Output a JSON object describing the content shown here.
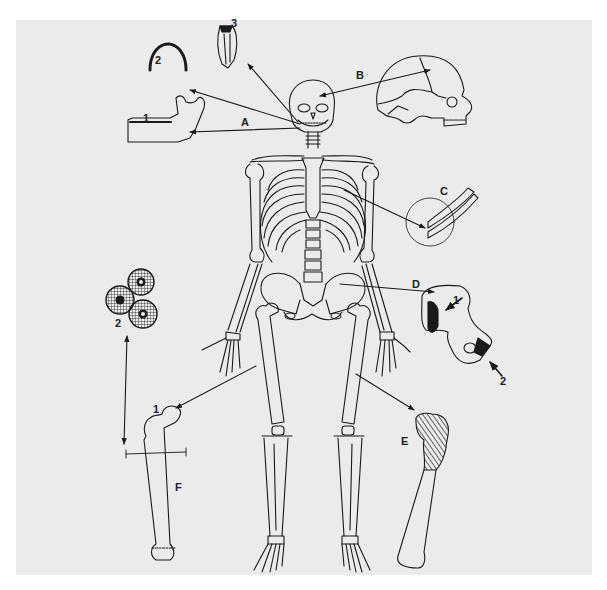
{
  "figure": {
    "type": "anatomical skeleton diagram with callouts",
    "background": "#ebebeb",
    "ink": "#1a1a1a",
    "center_subject": "full human skeleton, anterior view"
  },
  "callouts": {
    "A": {
      "letter": "A",
      "items": [
        {
          "number": "1",
          "subject": "mandible with teeth"
        },
        {
          "number": "2",
          "subject": "dental arch (upper teeth, occlusal view)"
        },
        {
          "number": "3",
          "subject": "single tooth, sectioned"
        }
      ]
    },
    "B": {
      "letter": "B",
      "subject": "skull, lateral view with sutures"
    },
    "C": {
      "letter": "C",
      "subject": "rib segments in circle"
    },
    "D": {
      "letter": "D",
      "subject": "pelvic bone fragment with marked areas",
      "items": [
        {
          "number": "1"
        },
        {
          "number": "2"
        }
      ]
    },
    "E": {
      "letter": "E",
      "subject": "femur with hatched proximal end"
    },
    "F": {
      "letter": "F",
      "subject": "femur with section line",
      "items": [
        {
          "number": "1",
          "subject": "femoral head"
        },
        {
          "number": "2",
          "subject": "bone cross-section (osteons)"
        }
      ]
    }
  }
}
